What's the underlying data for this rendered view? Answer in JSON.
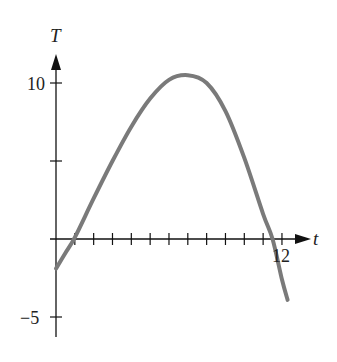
{
  "chart_data": {
    "type": "line",
    "title": "",
    "xlabel": "t",
    "ylabel": "T",
    "xlim": [
      0,
      12.5
    ],
    "ylim": [
      -6.5,
      11.5
    ],
    "x_ticks": [
      1,
      2,
      3,
      4,
      5,
      6,
      7,
      8,
      9,
      10,
      11,
      12
    ],
    "x_tick_labels": {
      "12": "12"
    },
    "y_ticks": [
      -5,
      5,
      10
    ],
    "y_tick_labels": {
      "10": "10",
      "-5": "−5"
    },
    "grid": false,
    "legend": null,
    "series": [
      {
        "name": "T(t)",
        "color": "#7a7a7a",
        "x": [
          0,
          0.5,
          1,
          2,
          3,
          4,
          5,
          6,
          7,
          8,
          9,
          10,
          11,
          11.5,
          12,
          12.3
        ],
        "y": [
          -1.9,
          -0.9,
          0.1,
          2.6,
          5.0,
          7.2,
          9.0,
          10.2,
          10.5,
          10.0,
          8.2,
          5.2,
          1.6,
          0.0,
          -2.6,
          -3.9
        ]
      }
    ]
  },
  "labels": {
    "x_axis": "t",
    "y_axis": "T",
    "tick_10": "10",
    "tick_neg5": "−5",
    "tick_12": "12"
  },
  "colors": {
    "axis": "#111111",
    "curve": "#7a7a7a"
  }
}
